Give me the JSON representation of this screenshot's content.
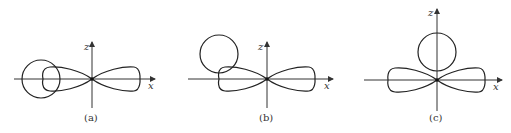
{
  "panels": [
    {
      "id": "a",
      "caption": "(a)",
      "x_label": "x",
      "z_label": "z",
      "origin": [
        92,
        79
      ],
      "circle": {
        "cx": 41,
        "cy": 79,
        "r": 19
      },
      "description": "Two-lobed orbital along x-axis; circle overlaps the left lobe on the x-axis"
    },
    {
      "id": "b",
      "caption": "(b)",
      "x_label": "x",
      "z_label": "z",
      "origin": [
        267,
        79
      ],
      "circle": {
        "cx": 219,
        "cy": 54,
        "r": 19
      },
      "description": "Two-lobed orbital along x-axis; circle displaced upper-left, partially overlapping the left lobe"
    },
    {
      "id": "c",
      "caption": "(c)",
      "x_label": "x",
      "z_label": "z",
      "origin": [
        437,
        80
      ],
      "circle": {
        "cx": 437,
        "cy": 52,
        "r": 19
      },
      "description": "Two-lobed orbital along x-axis; circle sits on z-axis above origin, touching both lobes"
    }
  ]
}
